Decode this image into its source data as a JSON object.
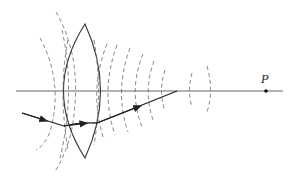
{
  "diagram": {
    "colors": {
      "line": "#333333",
      "wavefront": "#666666",
      "background": "#ffffff"
    },
    "labels": {
      "point": "P"
    },
    "elements": {
      "optical_axis": {
        "x1": 16,
        "y1": 91,
        "x2": 283,
        "y2": 91
      },
      "lens": {
        "top": [
          85,
          24
        ],
        "bottom": [
          85,
          158
        ],
        "left_x": 58,
        "right_x": 99
      },
      "focus_point": {
        "x": 266,
        "y": 91,
        "label": "P"
      },
      "ray": {
        "points": [
          [
            22,
            113
          ],
          [
            64,
            126
          ],
          [
            97,
            123
          ],
          [
            177,
            91
          ]
        ],
        "arrow_count": 3
      },
      "wavefronts_incoming": 3,
      "wavefronts_outgoing": 8
    }
  }
}
